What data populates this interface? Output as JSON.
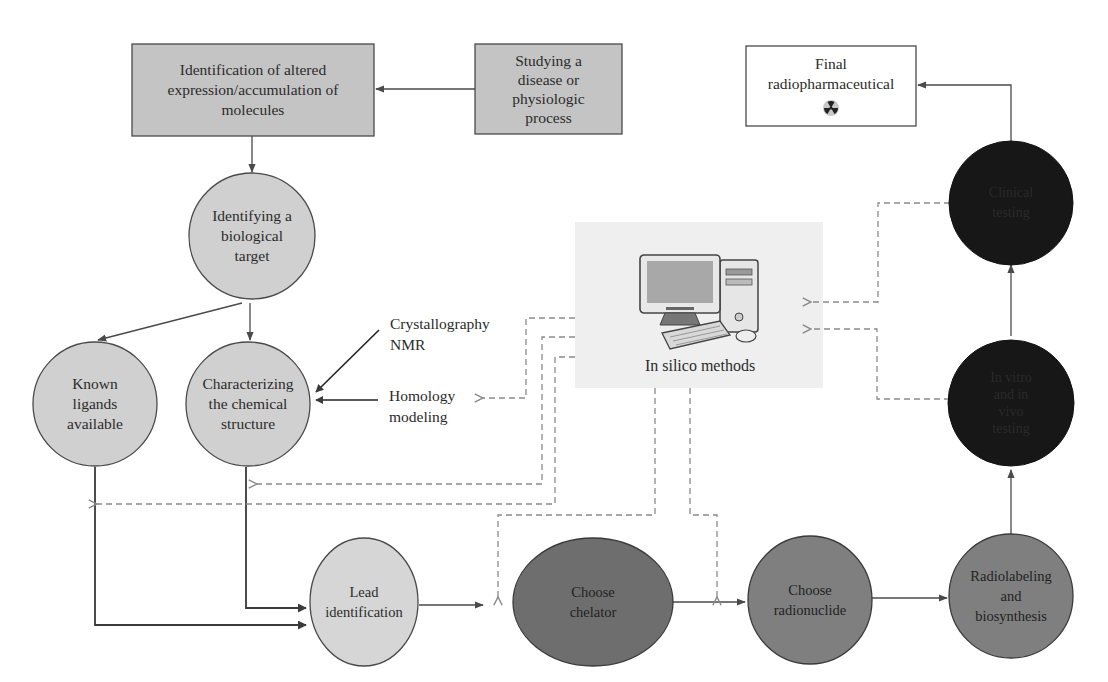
{
  "colors": {
    "box_fill": "#c4c4c4",
    "light_circle_fill": "#d0d0d0",
    "medium_circle_fill": "#7f7f7f",
    "dark_circle_fill": "#171717",
    "stroke": "#4a4a4a",
    "dashed": "#8a8a8a",
    "insilico_bg": "#efefef",
    "white_box_fill": "#ffffff"
  },
  "nodes": {
    "identification": {
      "label": "Identification of altered\nexpression/accumulation of\nmolecules",
      "shape": "rect"
    },
    "studying": {
      "label": "Studying a\ndisease or\nphysiologic\nprocess",
      "shape": "rect"
    },
    "final": {
      "label": "Final\nradiopharmaceutical",
      "shape": "rect",
      "icon": "radiation-icon"
    },
    "biological_target": {
      "label": "Identifying a\nbiological\ntarget",
      "shape": "circle"
    },
    "known_ligands": {
      "label": "Known\nligands\navailable",
      "shape": "circle"
    },
    "characterizing": {
      "label": "Characterizing\nthe chemical\nstructure",
      "shape": "circle"
    },
    "lead": {
      "label": "Lead\nidentification",
      "shape": "circle"
    },
    "chelator": {
      "label": "Choose\nchelator",
      "shape": "circle"
    },
    "radionuclide": {
      "label": "Choose\nradionuclide",
      "shape": "circle"
    },
    "radiolabeling": {
      "label": "Radiolabeling\nand\nbiosynthesis",
      "shape": "circle"
    },
    "invitro": {
      "label": "In vitro\nand in\nvivo\ntesting",
      "shape": "circle"
    },
    "clinical": {
      "label": "Clinical\ntesting",
      "shape": "circle"
    }
  },
  "annotations": {
    "crystallography": "Crystallography\nNMR",
    "homology": "Homology\nmodeling",
    "insilico": "In silico methods"
  },
  "icons": {
    "computer": "computer-icon",
    "radiation": "radiation-icon"
  }
}
